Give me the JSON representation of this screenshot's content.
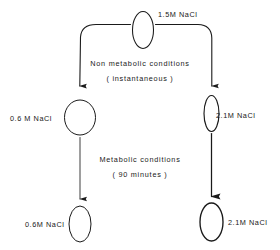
{
  "diagram": {
    "stroke_color": "#1a1a1a",
    "background_color": "#ffffff",
    "nodes": [
      {
        "id": "top-cell",
        "shape": "ellipse",
        "label": "1.5M NaCl",
        "label_position": "right",
        "fill": "none"
      },
      {
        "id": "mid-left-cell",
        "shape": "circle",
        "label": "0.6 M NaCl",
        "label_position": "left",
        "fill": "none"
      },
      {
        "id": "mid-right-cell",
        "shape": "ellipse-narrow",
        "label": "2.1M NaCl",
        "label_position": "right",
        "fill": "none"
      },
      {
        "id": "bottom-left-cell",
        "shape": "ellipse",
        "label": "0.6M NaCl",
        "label_position": "left",
        "fill": "none"
      },
      {
        "id": "bottom-right-cell",
        "shape": "ellipse",
        "label": "2.1M NaCl",
        "label_position": "right",
        "fill": "none"
      }
    ],
    "transitions": [
      {
        "id": "non-metabolic",
        "line1": "Non  metabolic  conditions",
        "line2": "( instantaneous )"
      },
      {
        "id": "metabolic",
        "line1": "Metabolic  conditions",
        "line2": "( 90  minutes )"
      }
    ]
  }
}
